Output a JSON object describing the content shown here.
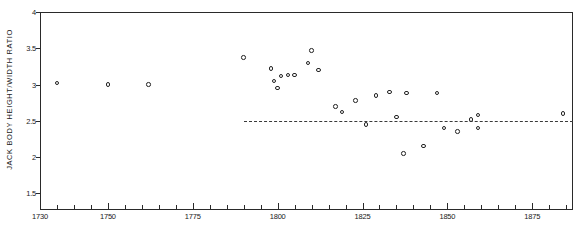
{
  "chart_data": {
    "type": "scatter",
    "title": "",
    "xlabel": "",
    "ylabel": "JACK BODY HEIGHT/WIDTH RATIO",
    "xlim": [
      1730,
      1887
    ],
    "ylim": [
      1.27,
      4.0
    ],
    "grid": false,
    "legend": null,
    "x_ticks_major": [
      1730,
      1750,
      1775,
      1800,
      1825,
      1850,
      1875
    ],
    "x_tick_labels": [
      "1730",
      "1750",
      "1775",
      "1800",
      "1825",
      "1850",
      "1875"
    ],
    "x_tick_minor_step": 5,
    "y_ticks": [
      1.5,
      2,
      2.5,
      3,
      3.5,
      4
    ],
    "y_tick_labels": [
      "1.5",
      "2",
      "2.5",
      "3",
      "3.5",
      "4"
    ],
    "annotations": [
      {
        "name": "reference-line",
        "style": "dashed",
        "y": 2.5,
        "x_start": 1790,
        "x_end": 1887
      }
    ],
    "points": [
      {
        "x": 1735,
        "y": 3.02
      },
      {
        "x": 1750,
        "y": 3.0
      },
      {
        "x": 1762,
        "y": 3.0
      },
      {
        "x": 1790,
        "y": 3.37
      },
      {
        "x": 1798,
        "y": 3.22
      },
      {
        "x": 1799,
        "y": 3.05
      },
      {
        "x": 1801,
        "y": 3.12
      },
      {
        "x": 1803,
        "y": 3.13
      },
      {
        "x": 1805,
        "y": 3.13
      },
      {
        "x": 1800,
        "y": 2.95
      },
      {
        "x": 1810,
        "y": 3.47
      },
      {
        "x": 1809,
        "y": 3.3
      },
      {
        "x": 1812,
        "y": 3.2
      },
      {
        "x": 1817,
        "y": 2.7
      },
      {
        "x": 1819,
        "y": 2.62
      },
      {
        "x": 1823,
        "y": 2.78
      },
      {
        "x": 1826,
        "y": 2.45
      },
      {
        "x": 1829,
        "y": 2.85
      },
      {
        "x": 1833,
        "y": 2.9
      },
      {
        "x": 1835,
        "y": 2.55
      },
      {
        "x": 1838,
        "y": 2.88
      },
      {
        "x": 1837,
        "y": 2.05
      },
      {
        "x": 1843,
        "y": 2.15
      },
      {
        "x": 1847,
        "y": 2.88
      },
      {
        "x": 1849,
        "y": 2.4
      },
      {
        "x": 1853,
        "y": 2.35
      },
      {
        "x": 1857,
        "y": 2.52
      },
      {
        "x": 1859,
        "y": 2.58
      },
      {
        "x": 1859,
        "y": 2.4
      },
      {
        "x": 1884,
        "y": 2.6
      }
    ]
  }
}
